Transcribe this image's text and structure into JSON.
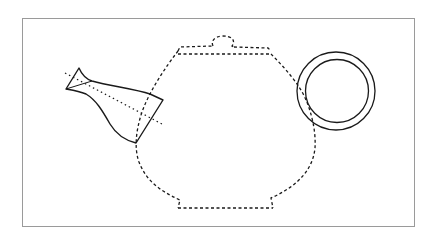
{
  "diagram": {
    "subject": "teapot construction drawing",
    "colors": {
      "background": "#ffffff",
      "frame": "#9a9a9a",
      "stroke": "#1a1a1a"
    },
    "parts": [
      {
        "id": "body",
        "label": "Teapot body",
        "style": "dashed outline"
      },
      {
        "id": "lid",
        "label": "Lid with knob",
        "style": "dashed outline"
      },
      {
        "id": "spout",
        "label": "Spout",
        "style": "solid outline"
      },
      {
        "id": "spout-axis",
        "label": "Spout axis",
        "style": "dotted line"
      },
      {
        "id": "handle",
        "label": "Ring handle",
        "style": "two concentric circles"
      }
    ]
  }
}
